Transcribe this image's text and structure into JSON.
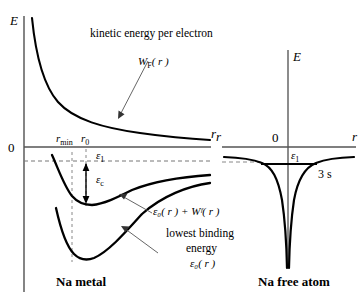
{
  "figure": {
    "panels": [
      {
        "id": "na-metal",
        "caption": "Na metal",
        "axes": {
          "y_label": "E",
          "x_label": "r",
          "origin_label": "0"
        },
        "ticks": [
          {
            "id": "r-min",
            "label_main": "r",
            "label_sub": "min"
          },
          {
            "id": "r-zero",
            "label_main": "r",
            "label_sub": "0"
          }
        ],
        "annotations": [
          {
            "id": "kinetic-energy",
            "text": "kinetic energy per electron"
          },
          {
            "id": "wf-formula",
            "main": "W",
            "sub": "F",
            "arg": "( r )"
          },
          {
            "id": "eps-one",
            "main": "ε",
            "sub": "1"
          },
          {
            "id": "eps-c",
            "main": "ε",
            "sub": "c"
          },
          {
            "id": "sum-curve",
            "text": "ε₀( r ) + Wᶠ( r )"
          },
          {
            "id": "lowest-binding-1",
            "text": "lowest binding"
          },
          {
            "id": "lowest-binding-2",
            "text": "energy"
          },
          {
            "id": "lowest-binding-3",
            "text": "ε₀( r )"
          }
        ],
        "curves": [
          {
            "id": "kinetic-energy-curve",
            "name": "W_F(r) kinetic energy per electron"
          },
          {
            "id": "sum-energy-curve",
            "name": "eps_0(r) + W_F(r)"
          },
          {
            "id": "binding-energy-curve",
            "name": "eps_0(r) lowest binding energy"
          }
        ]
      },
      {
        "id": "na-free-atom",
        "caption": "Na free atom",
        "axes": {
          "y_label": "E",
          "x_label_left": "r",
          "x_label_right": "r",
          "origin_label": "0"
        },
        "annotations": [
          {
            "id": "eps-one-right",
            "main": "ε",
            "sub": "1"
          },
          {
            "id": "orbital-3s",
            "text": "3 s"
          }
        ],
        "curves": [
          {
            "id": "coulomb-well",
            "name": "Coulomb potential well"
          },
          {
            "id": "level-3s",
            "name": "3s energy level"
          }
        ]
      }
    ],
    "colors": {
      "ink": "#000000",
      "axis": "#555555",
      "dashed": "#777777",
      "background": "#ffffff"
    }
  }
}
